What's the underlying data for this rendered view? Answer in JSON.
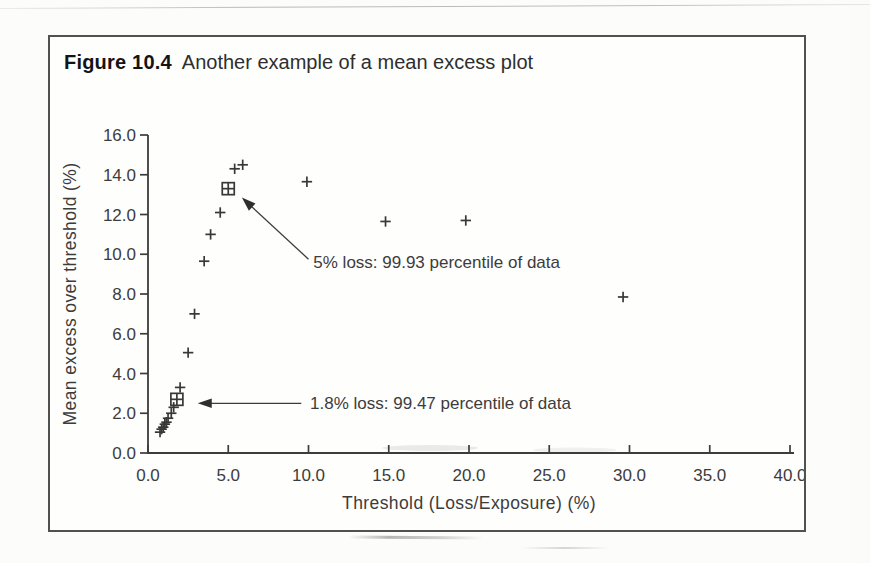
{
  "figure": {
    "label": "Figure 10.4",
    "caption": "Another example of a mean excess plot"
  },
  "chart_data": {
    "type": "scatter",
    "marker_glyph": "plus",
    "xlabel": "Threshold (Loss/Exposure) (%)",
    "ylabel": "Mean excess over threshold (%)",
    "xlim": [
      0.0,
      40.0
    ],
    "ylim": [
      0.0,
      16.0
    ],
    "xticks": [
      0,
      5,
      10,
      15,
      20,
      25,
      30,
      35,
      40
    ],
    "yticks": [
      0,
      2,
      4,
      6,
      8,
      10,
      12,
      14,
      16
    ],
    "tick_label_decimals": 1,
    "grid": false,
    "legend": "none",
    "points": [
      [
        0.75,
        1.05
      ],
      [
        0.85,
        1.2
      ],
      [
        0.95,
        1.3
      ],
      [
        1.05,
        1.45
      ],
      [
        1.15,
        1.55
      ],
      [
        1.25,
        1.75
      ],
      [
        1.45,
        2.0
      ],
      [
        1.6,
        2.3
      ],
      [
        2.0,
        3.3
      ],
      [
        2.5,
        5.05
      ],
      [
        2.9,
        7.0
      ],
      [
        3.5,
        9.65
      ],
      [
        3.9,
        11.0
      ],
      [
        4.5,
        12.1
      ],
      [
        5.4,
        14.3
      ],
      [
        5.9,
        14.5
      ],
      [
        9.9,
        13.65
      ],
      [
        14.8,
        11.65
      ],
      [
        19.8,
        11.7
      ],
      [
        29.6,
        7.85
      ]
    ],
    "boxed_points": [
      [
        1.8,
        2.7
      ],
      [
        5.0,
        13.3
      ]
    ],
    "annotations": [
      {
        "text": "5% loss:  99.93 percentile of data",
        "text_x": 10.3,
        "text_y": 9.3,
        "arrow_from": [
          10.0,
          9.75
        ],
        "arrow_to": [
          5.85,
          12.85
        ]
      },
      {
        "text": "1.8% loss:  99.47 percentile of data",
        "text_x": 10.1,
        "text_y": 2.2,
        "arrow_from": [
          9.55,
          2.5
        ],
        "arrow_to": [
          3.1,
          2.5
        ]
      }
    ]
  },
  "colors": {
    "ink": "#3c3c3c",
    "marker": "#383838",
    "title": "#141414",
    "box_border": "#515151",
    "paper": "#fcfcfa"
  }
}
